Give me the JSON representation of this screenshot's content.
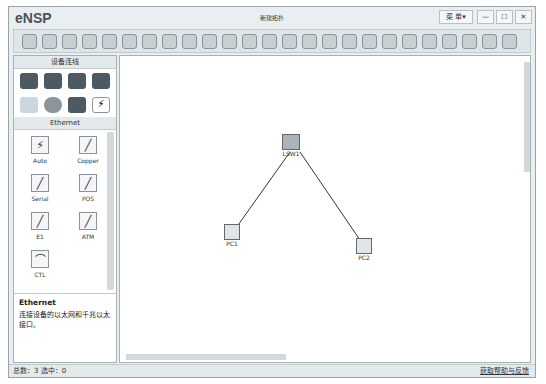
{
  "window": {
    "app": "eNSP",
    "title": "新建拓扑",
    "menu": "菜 单▾",
    "minimize": "—",
    "maximize": "☐",
    "close": "✕"
  },
  "toolbar": {
    "count": 25
  },
  "left_panel": {
    "section_title": "设备连线",
    "device_icons": [
      "router-icon",
      "switch-icon",
      "wlan-icon",
      "firewall-icon",
      "pc-icon",
      "cloud-icon",
      "other-device-icon",
      "cable-icon"
    ],
    "category": "Ethernet",
    "cables": [
      {
        "label": "Auto",
        "glyph": "⚡"
      },
      {
        "label": "Copper",
        "glyph": "╱"
      },
      {
        "label": "Serial",
        "glyph": "╱"
      },
      {
        "label": "POS",
        "glyph": "╱"
      },
      {
        "label": "E1",
        "glyph": "╱"
      },
      {
        "label": "ATM",
        "glyph": "╱"
      },
      {
        "label": "CTL",
        "glyph": "⌒"
      }
    ],
    "info_title": "Ethernet",
    "info_text": "连接设备的以太网和千兆以太接口。"
  },
  "canvas": {
    "nodes": [
      {
        "label": "LSW1"
      },
      {
        "label": "PC1"
      },
      {
        "label": "PC2"
      }
    ]
  },
  "status": {
    "left": "总数：3 选中：0",
    "right": "获取帮助与反馈"
  }
}
